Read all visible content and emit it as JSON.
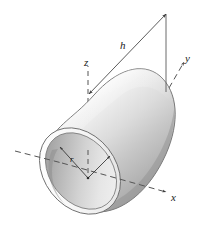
{
  "figure": {
    "kind": "3d-paraboloid-solid-with-axes",
    "background_color": "#ffffff",
    "line_color": "#3a3a3a",
    "dash_color": "#555555",
    "surface": {
      "highlight_color": "#fbfbfb",
      "light_color": "#ededed",
      "mid_color": "#cfcfcf",
      "dark_color": "#a8a8a8",
      "shadow_color": "#8f8f8f",
      "interior_light": "#e6e6e6",
      "interior_dark": "#a9a9a9",
      "rim_color": "#fdfdfd"
    },
    "labels": {
      "z_axis": "z",
      "y_axis": "y",
      "x_axis": "x",
      "height": "h",
      "radius": "r"
    },
    "annotations": [
      {
        "name": "height-dimension",
        "symbol": "h",
        "kind": "double-headed-dimension-arrow"
      },
      {
        "name": "radius-dimension",
        "symbol": "r",
        "kind": "radius-arrow-from-center"
      },
      {
        "name": "second-radius-arrow",
        "symbol": "",
        "kind": "radius-arrow-from-center"
      }
    ]
  }
}
